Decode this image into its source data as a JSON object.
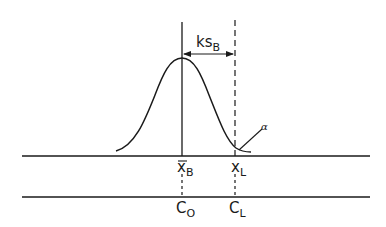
{
  "diagram": {
    "type": "normal-distribution-decision-limit",
    "labels": {
      "ks_base": "ks",
      "ks_sub": "B",
      "xbar_base": "x",
      "xbar_sub": "B",
      "xl_base": "x",
      "xl_sub": "L",
      "co_base": "C",
      "co_sub": "O",
      "cl_base": "C",
      "cl_sub": "L",
      "alpha": "α"
    },
    "colors": {
      "stroke": "#1a1a1a",
      "background": "#ffffff"
    }
  }
}
